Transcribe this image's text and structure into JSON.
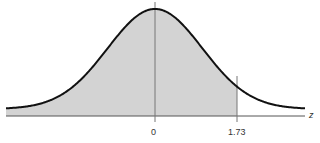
{
  "chart_data": {
    "type": "area",
    "title": "",
    "xlabel": "z",
    "ylabel": "",
    "distribution": "standard normal",
    "mean": 0,
    "sd": 1,
    "shaded_region": {
      "from": "-inf",
      "to": 1.73
    },
    "reference_lines": [
      0,
      1.73
    ],
    "tick_labels": [
      "0",
      "1.73"
    ],
    "xlim": [
      -3.15,
      3.15
    ],
    "grid": false,
    "colors": {
      "curve": "#111111",
      "fill": "#d3d3d3",
      "axis": "#555555",
      "refline": "#777777"
    }
  },
  "labels": {
    "zero": "0",
    "cutoff": "1.73",
    "axis": "z"
  }
}
